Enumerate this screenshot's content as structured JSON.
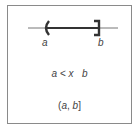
{
  "diagram": {
    "type": "number-line-interval",
    "left_endpoint": {
      "label": "a",
      "bracket": "(",
      "closed": false
    },
    "right_endpoint": {
      "label": "b",
      "bracket": "]",
      "closed": true
    },
    "inequality": {
      "left": "a",
      "op1": "<",
      "var": "x",
      "op2": "",
      "right": "b"
    },
    "interval_notation": {
      "open": "(",
      "left": "a",
      "sep": ",",
      "right": "b",
      "close": "]"
    }
  },
  "colors": {
    "line": "#555555",
    "segment": "#333333",
    "border": "#8a8a8a",
    "text": "#444444"
  }
}
